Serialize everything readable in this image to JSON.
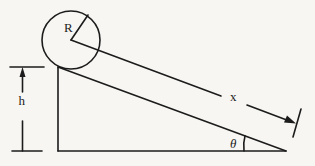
{
  "diagram": {
    "labels": {
      "radius": "R",
      "height": "h",
      "distance": "x",
      "angle": "θ"
    },
    "elements": [
      "ball",
      "radius-line",
      "incline",
      "vertical-side",
      "base",
      "center-path-line",
      "distance-arrow",
      "height-dimension",
      "angle-arc"
    ]
  }
}
